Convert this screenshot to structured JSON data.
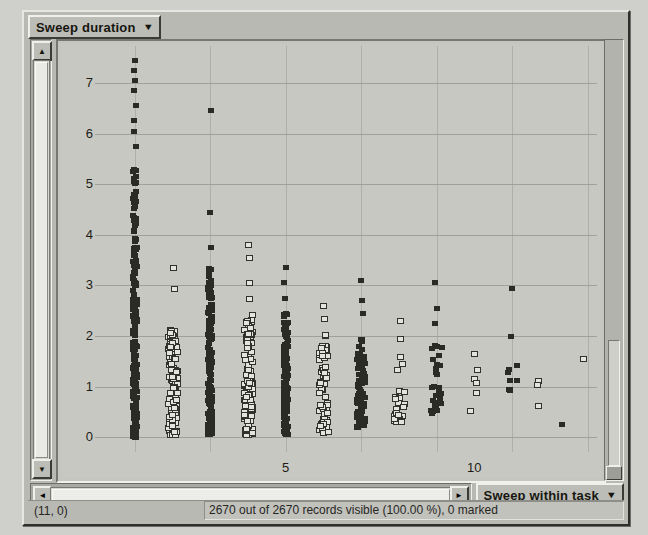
{
  "window": {
    "title": ""
  },
  "y_selector": {
    "label": "Sweep duration",
    "caret": "▼"
  },
  "x_selector": {
    "label": "Sweep within task",
    "caret": "▼"
  },
  "status": {
    "coordinates": "(11, 0)",
    "message": "2670 out of 2670 records visible (100.00 %), 0 marked"
  },
  "scrollbars": {
    "v_up": "▲",
    "v_down": "▼",
    "h_left": "◄",
    "h_right": "►"
  },
  "chart_data": {
    "type": "scatter",
    "title": "",
    "xlabel": "Sweep within task",
    "ylabel": "Sweep duration",
    "xlim": [
      0,
      13.2
    ],
    "ylim": [
      -0.25,
      7.65
    ],
    "xticks": [
      5,
      10
    ],
    "xtick_labels": [
      "5",
      "10"
    ],
    "yticks": [
      0,
      1,
      2,
      3,
      4,
      5,
      6,
      7
    ],
    "ytick_labels": [
      "0",
      "1",
      "2",
      "3",
      "4",
      "5",
      "6",
      "7"
    ],
    "grid": true,
    "grid_x": [
      1,
      3,
      5,
      7,
      9,
      11,
      13
    ],
    "legend": "none",
    "total_records": 2670,
    "visible_records": 2670,
    "percent_visible": "100.00 %",
    "marked": 0,
    "marker_styles": {
      "filled": "#2b2b26",
      "open": "#e4e4df"
    },
    "series": [
      {
        "name": "filled-squares",
        "marker": "filled",
        "columns": [
          {
            "x": 1.0,
            "y_min": 0.0,
            "y_max": 5.35,
            "count": 210,
            "density": "solid",
            "outliers": [
              5.75,
              6.05,
              6.25,
              6.55,
              6.85,
              7.05,
              7.25,
              7.45
            ]
          },
          {
            "x": 3.0,
            "y_min": 0.05,
            "y_max": 3.35,
            "count": 180,
            "density": "solid",
            "outliers": [
              3.75,
              4.45,
              6.45
            ]
          },
          {
            "x": 5.0,
            "y_min": 0.05,
            "y_max": 2.45,
            "count": 150,
            "density": "solid",
            "outliers": [
              2.75,
              3.05,
              3.35
            ]
          },
          {
            "x": 7.0,
            "y_min": 0.2,
            "y_max": 1.95,
            "count": 90,
            "density": "medium",
            "outliers": [
              2.45,
              2.7,
              3.1
            ]
          },
          {
            "x": 9.0,
            "y_min": 0.45,
            "y_max": 1.85,
            "count": 28,
            "density": "sparse",
            "outliers": [
              2.25,
              2.55,
              3.05
            ]
          },
          {
            "x": 11.0,
            "y_min": 0.85,
            "y_max": 1.45,
            "count": 8,
            "density": "sparse",
            "outliers": [
              2.0,
              2.95
            ]
          },
          {
            "x": 12.3,
            "y_min": 0.25,
            "y_max": 0.25,
            "count": 1,
            "density": "sparse",
            "outliers": []
          }
        ]
      },
      {
        "name": "open-squares",
        "marker": "open",
        "columns": [
          {
            "x": 2.0,
            "y_min": 0.05,
            "y_max": 2.15,
            "count": 120,
            "density": "medium",
            "outliers": [
              2.95,
              3.35
            ]
          },
          {
            "x": 4.0,
            "y_min": 0.05,
            "y_max": 2.45,
            "count": 110,
            "density": "medium",
            "outliers": [
              2.75,
              3.05,
              3.55,
              3.8
            ]
          },
          {
            "x": 6.0,
            "y_min": 0.1,
            "y_max": 2.1,
            "count": 70,
            "density": "medium",
            "outliers": [
              2.35,
              2.6
            ]
          },
          {
            "x": 8.0,
            "y_min": 0.3,
            "y_max": 1.6,
            "count": 24,
            "density": "sparse",
            "outliers": [
              1.95,
              2.3
            ]
          },
          {
            "x": 10.0,
            "y_min": 0.35,
            "y_max": 1.35,
            "count": 5,
            "density": "sparse",
            "outliers": [
              1.65
            ]
          },
          {
            "x": 11.6,
            "y_min": 0.55,
            "y_max": 1.2,
            "count": 3,
            "density": "sparse",
            "outliers": []
          },
          {
            "x": 13.0,
            "y_min": 1.55,
            "y_max": 1.55,
            "count": 1,
            "density": "sparse",
            "outliers": []
          }
        ]
      }
    ]
  }
}
